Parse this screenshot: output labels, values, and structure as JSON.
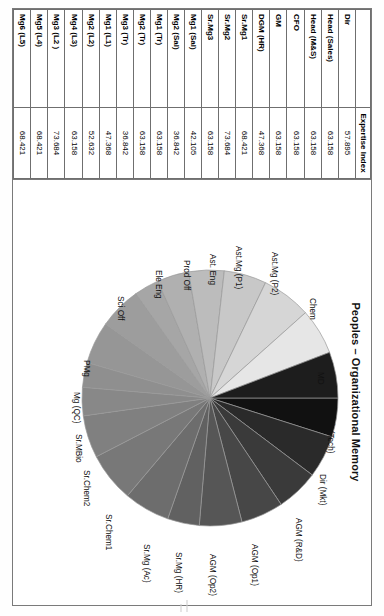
{
  "chart_data": {
    "type": "pie",
    "title": "Peoples – Organizational Memory",
    "value_label": "Expertise Index",
    "legend_position": "labels-around-slices",
    "categories": [
      "MD",
      "Dir (Tech)",
      "Dir (Mkt)",
      "AGM (R&D)",
      "AGM (Op1)",
      "AGM (Op2)",
      "Sr.Mg (HR)",
      "Sr.Mg (Ac)",
      "Sr.Chem1",
      "Sr.Chem2",
      "Sr.MBio",
      "Mg (QC)",
      "PMg",
      "Sci Off",
      "Ele Eng",
      "Prod Off",
      "Ast. Eng",
      "Ast.Mg (P1)",
      "Ast.Mg (P2)",
      "Chem"
    ],
    "values": [
      57.895,
      63.158,
      63.158,
      63.158,
      63.158,
      47.368,
      68.421,
      73.684,
      63.158,
      42.105,
      36.842,
      63.158,
      63.158,
      36.842,
      47.368,
      52.632,
      63.158,
      73.684,
      68.421,
      68.421
    ]
  },
  "title": "Peoples – Organizational Memory",
  "table": {
    "headers": [
      "",
      "Expertise Index"
    ],
    "rows": [
      {
        "label": "Dir",
        "value": "57.895"
      },
      {
        "label": "Head (Sales)",
        "value": "63.158"
      },
      {
        "label": "Head (M&S)",
        "value": "63.158"
      },
      {
        "label": "CFO",
        "value": "63.158"
      },
      {
        "label": "GM",
        "value": "63.158"
      },
      {
        "label": "DGM (HR)",
        "value": "47.368"
      },
      {
        "label": "Sr.Mg1",
        "value": "68.421"
      },
      {
        "label": "Sr.Mg2",
        "value": "73.684"
      },
      {
        "label": "Sr.Mg3",
        "value": "63.158"
      },
      {
        "label": "Mg1 (Sal)",
        "value": "42.105"
      },
      {
        "label": "Mg2 (Sal)",
        "value": "36.842"
      },
      {
        "label": "Mg1 (Tr)",
        "value": "63.158"
      },
      {
        "label": "Mg2 (Tr)",
        "value": "63.158"
      },
      {
        "label": "Mg3 (Tr)",
        "value": "36.842"
      },
      {
        "label": "Mg1 (L1)",
        "value": "47.368"
      },
      {
        "label": "Mg2 (L2)",
        "value": "52.632"
      },
      {
        "label": "Mg4 (L3)",
        "value": "63.158"
      },
      {
        "label": "Mg3 (L2 )",
        "value": "73.684"
      },
      {
        "label": "Mg5 (L4)",
        "value": "68.421"
      },
      {
        "label": "Mg6 (L5)",
        "value": "68.421"
      }
    ]
  },
  "pie_labels": [
    {
      "text": "MD",
      "x": 104,
      "y": 16,
      "rot": 0
    },
    {
      "text": "Dir (Tech)",
      "x": 150,
      "y": 6,
      "rot": 0
    },
    {
      "text": "Dir (Mkt)",
      "x": 206,
      "y": 14,
      "rot": 0
    },
    {
      "text": "AGM (R&D)",
      "x": 250,
      "y": 38,
      "rot": 0
    },
    {
      "text": "AGM (Op1)",
      "x": 276,
      "y": 82,
      "rot": 0
    },
    {
      "text": "AGM (Op2)",
      "x": 286,
      "y": 124,
      "rot": 0
    },
    {
      "text": "Sr.Mg (HR)",
      "x": 284,
      "y": 158,
      "rot": 0
    },
    {
      "text": "Sr.Mg (Ac)",
      "x": 276,
      "y": 190,
      "rot": 0
    },
    {
      "text": "Sr.Chem1",
      "x": 246,
      "y": 228,
      "rot": 0
    },
    {
      "text": "Sr.Chem2",
      "x": 202,
      "y": 250,
      "rot": 0
    },
    {
      "text": "Sr.MBio",
      "x": 166,
      "y": 258,
      "rot": 0
    },
    {
      "text": "Mg (QC)",
      "x": 124,
      "y": 260,
      "rot": 0
    },
    {
      "text": "PMg",
      "x": 92,
      "y": 250,
      "rot": 0
    },
    {
      "text": "Sci Off",
      "x": 28,
      "y": 216,
      "rot": 0
    },
    {
      "text": "Ele Eng",
      "x": 2,
      "y": 178,
      "rot": 0
    },
    {
      "text": "Prod Off",
      "x": -8,
      "y": 150,
      "rot": 0
    },
    {
      "text": "Ast. Eng",
      "x": -14,
      "y": 124,
      "rot": 0
    },
    {
      "text": "Ast.Mg (P1)",
      "x": -22,
      "y": 98,
      "rot": 0
    },
    {
      "text": "Ast.Mg (P2)",
      "x": -16,
      "y": 62,
      "rot": 0
    },
    {
      "text": "Chem",
      "x": 30,
      "y": 24,
      "rot": 0
    }
  ],
  "colors": {
    "slices": [
      "#111111",
      "#2a2a2a",
      "#3a3a3a",
      "#474747",
      "#565656",
      "#616161",
      "#6d6d6d",
      "#787878",
      "#808080",
      "#888888",
      "#8f8f8f",
      "#969696",
      "#9d9d9d",
      "#a6a6a6",
      "#b0b0b0",
      "#bcbcbc",
      "#c8c8c8",
      "#d6d6d6",
      "#e6e6e6",
      "#1d1d1d"
    ],
    "border": "#7a7a7a",
    "slice_outline": "#9a9a9a",
    "page": "#ffffff",
    "text": "#111111"
  }
}
